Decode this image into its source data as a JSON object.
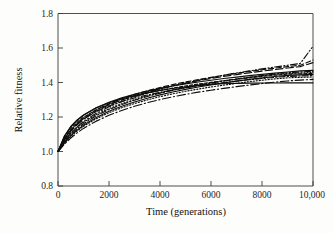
{
  "figure": {
    "title": "",
    "background_color": "#fdfdfb",
    "axis_color": "#3b3b3b",
    "curve_color": "#0d0d0d"
  },
  "chart_data": {
    "type": "line",
    "title": "",
    "subtitle": "",
    "xlabel": "Time (generations)",
    "ylabel": "Relative fitness",
    "xlim": [
      0,
      10000
    ],
    "ylim": [
      0.8,
      1.8
    ],
    "grid": false,
    "legend": "none",
    "xticks": [
      0,
      2000,
      4000,
      6000,
      8000,
      10000
    ],
    "xtick_labels": [
      "0",
      "2000",
      "4000",
      "6000",
      "8000",
      "10,000"
    ],
    "yticks": [
      0.8,
      1.0,
      1.2,
      1.4,
      1.6,
      1.8
    ],
    "ytick_labels": [
      "0.8",
      "1.0",
      "1.2",
      "1.4",
      "1.6",
      "1.8"
    ],
    "x": [
      0,
      250,
      500,
      750,
      1000,
      1500,
      2000,
      2500,
      3000,
      3500,
      4000,
      4500,
      5000,
      5500,
      6000,
      6500,
      7000,
      7500,
      8000,
      8500,
      9000,
      9500,
      10000
    ],
    "series": [
      {
        "name": "population-1",
        "style": "dashdotdot",
        "final_value": 1.61,
        "values": [
          1.0,
          1.062,
          1.108,
          1.144,
          1.174,
          1.222,
          1.259,
          1.29,
          1.317,
          1.34,
          1.361,
          1.38,
          1.397,
          1.413,
          1.428,
          1.442,
          1.455,
          1.467,
          1.479,
          1.49,
          1.5,
          1.51,
          1.61
        ]
      },
      {
        "name": "population-2",
        "style": "dashed",
        "final_value": 1.53,
        "values": [
          1.0,
          1.072,
          1.123,
          1.162,
          1.193,
          1.241,
          1.277,
          1.306,
          1.331,
          1.352,
          1.371,
          1.388,
          1.403,
          1.417,
          1.43,
          1.442,
          1.453,
          1.464,
          1.474,
          1.483,
          1.492,
          1.5,
          1.53
        ]
      },
      {
        "name": "population-3",
        "style": "dashed-long",
        "final_value": 1.515,
        "values": [
          1.0,
          1.068,
          1.117,
          1.155,
          1.186,
          1.234,
          1.27,
          1.299,
          1.324,
          1.345,
          1.364,
          1.381,
          1.396,
          1.41,
          1.423,
          1.435,
          1.446,
          1.456,
          1.466,
          1.475,
          1.484,
          1.492,
          1.515
        ]
      },
      {
        "name": "population-4",
        "style": "solid",
        "final_value": 1.47,
        "values": [
          1.0,
          1.086,
          1.141,
          1.18,
          1.21,
          1.254,
          1.286,
          1.311,
          1.332,
          1.35,
          1.366,
          1.38,
          1.392,
          1.403,
          1.413,
          1.423,
          1.431,
          1.44,
          1.447,
          1.454,
          1.461,
          1.467,
          1.47
        ]
      },
      {
        "name": "population-5",
        "style": "dashdot",
        "final_value": 1.465,
        "values": [
          1.0,
          1.055,
          1.098,
          1.132,
          1.161,
          1.207,
          1.243,
          1.272,
          1.297,
          1.319,
          1.338,
          1.355,
          1.37,
          1.384,
          1.397,
          1.409,
          1.42,
          1.43,
          1.44,
          1.449,
          1.457,
          1.461,
          1.465
        ]
      },
      {
        "name": "population-6",
        "style": "dotted",
        "final_value": 1.458,
        "values": [
          1.0,
          1.06,
          1.105,
          1.14,
          1.169,
          1.214,
          1.249,
          1.277,
          1.301,
          1.322,
          1.341,
          1.357,
          1.372,
          1.386,
          1.398,
          1.409,
          1.42,
          1.43,
          1.439,
          1.447,
          1.452,
          1.455,
          1.458
        ]
      },
      {
        "name": "population-7",
        "style": "dashed-short",
        "final_value": 1.452,
        "values": [
          1.0,
          1.079,
          1.132,
          1.17,
          1.199,
          1.242,
          1.274,
          1.299,
          1.32,
          1.338,
          1.354,
          1.368,
          1.38,
          1.391,
          1.401,
          1.411,
          1.419,
          1.427,
          1.435,
          1.442,
          1.448,
          1.45,
          1.452
        ]
      },
      {
        "name": "population-8",
        "style": "solid",
        "final_value": 1.447,
        "values": [
          1.0,
          1.05,
          1.091,
          1.124,
          1.152,
          1.197,
          1.233,
          1.262,
          1.287,
          1.309,
          1.328,
          1.345,
          1.36,
          1.374,
          1.386,
          1.398,
          1.408,
          1.418,
          1.427,
          1.435,
          1.441,
          1.444,
          1.447
        ]
      },
      {
        "name": "population-9",
        "style": "dashdot",
        "final_value": 1.44,
        "values": [
          1.0,
          1.073,
          1.124,
          1.161,
          1.19,
          1.232,
          1.264,
          1.289,
          1.31,
          1.328,
          1.343,
          1.357,
          1.369,
          1.38,
          1.39,
          1.399,
          1.408,
          1.416,
          1.423,
          1.43,
          1.435,
          1.438,
          1.44
        ]
      },
      {
        "name": "population-10",
        "style": "dotted",
        "final_value": 1.432,
        "values": [
          1.0,
          1.047,
          1.087,
          1.119,
          1.146,
          1.19,
          1.225,
          1.254,
          1.278,
          1.299,
          1.318,
          1.334,
          1.349,
          1.362,
          1.374,
          1.385,
          1.395,
          1.405,
          1.413,
          1.421,
          1.427,
          1.43,
          1.432
        ]
      },
      {
        "name": "population-11",
        "style": "solid",
        "final_value": 1.398,
        "values": [
          1.0,
          1.09,
          1.145,
          1.183,
          1.212,
          1.253,
          1.283,
          1.306,
          1.325,
          1.34,
          1.354,
          1.365,
          1.375,
          1.383,
          1.39,
          1.393,
          1.395,
          1.396,
          1.397,
          1.397,
          1.398,
          1.398,
          1.398
        ]
      },
      {
        "name": "population-12",
        "style": "dashdot-long",
        "final_value": 1.418,
        "values": [
          1.0,
          1.042,
          1.078,
          1.108,
          1.134,
          1.176,
          1.21,
          1.238,
          1.262,
          1.283,
          1.301,
          1.317,
          1.331,
          1.344,
          1.355,
          1.366,
          1.376,
          1.385,
          1.394,
          1.402,
          1.409,
          1.414,
          1.418
        ]
      }
    ]
  }
}
